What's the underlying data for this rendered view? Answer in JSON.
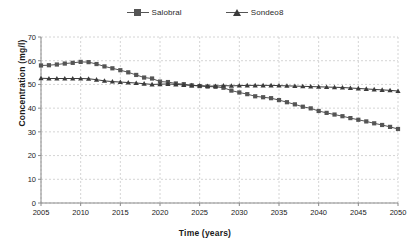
{
  "chart_data": {
    "type": "line",
    "title": "",
    "xlabel": "Time (years)",
    "ylabel": "Concentration (mg/l)",
    "xlim": [
      2005,
      2050
    ],
    "ylim": [
      0,
      70
    ],
    "ytick_step": 10,
    "xtick_step": 5,
    "xticks": [
      "2005",
      "2010",
      "2015",
      "2020",
      "2025",
      "2030",
      "2035",
      "2040",
      "2045",
      "2050"
    ],
    "yticks": [
      "0",
      "10",
      "20",
      "30",
      "40",
      "50",
      "60",
      "70"
    ],
    "grid": true,
    "grid_style": "dashed",
    "grid_color": "#c9c9c9",
    "legend_position": "top-center",
    "x": [
      2005,
      2006,
      2007,
      2008,
      2009,
      2010,
      2011,
      2012,
      2013,
      2014,
      2015,
      2016,
      2017,
      2018,
      2019,
      2020,
      2021,
      2022,
      2023,
      2024,
      2025,
      2026,
      2027,
      2028,
      2029,
      2030,
      2031,
      2032,
      2033,
      2034,
      2035,
      2036,
      2037,
      2038,
      2039,
      2040,
      2041,
      2042,
      2043,
      2044,
      2045,
      2046,
      2047,
      2048,
      2049,
      2050
    ],
    "series": [
      {
        "name": "Salobral",
        "color": "#555555",
        "marker": "square",
        "values": [
          58.0,
          58.1,
          58.4,
          58.8,
          59.1,
          59.5,
          59.4,
          58.6,
          57.6,
          56.8,
          56.0,
          55.1,
          54.0,
          52.9,
          52.5,
          51.2,
          51.0,
          50.4,
          50.1,
          49.6,
          49.3,
          49.1,
          49.0,
          48.6,
          47.4,
          46.6,
          45.9,
          45.0,
          44.6,
          44.2,
          43.4,
          42.5,
          41.6,
          40.6,
          39.9,
          38.8,
          38.0,
          37.3,
          36.6,
          35.8,
          35.1,
          34.4,
          33.6,
          32.9,
          32.1,
          31.2
        ]
      },
      {
        "name": "Sondeo8",
        "color": "#3b3b3b",
        "marker": "triangle",
        "values": [
          52.6,
          52.5,
          52.5,
          52.5,
          52.5,
          52.5,
          52.4,
          52.0,
          51.5,
          51.2,
          51.0,
          50.8,
          50.6,
          50.3,
          50.0,
          50.1,
          50.2,
          50.0,
          49.8,
          49.6,
          49.5,
          49.3,
          49.3,
          49.5,
          49.4,
          49.5,
          49.6,
          49.6,
          49.6,
          49.6,
          49.5,
          49.4,
          49.3,
          49.2,
          49.1,
          49.0,
          48.9,
          48.8,
          48.7,
          48.5,
          48.3,
          48.1,
          47.9,
          47.7,
          47.5,
          47.2
        ]
      }
    ]
  },
  "legend": {
    "items": [
      {
        "label": "Salobral",
        "marker": "square-marker"
      },
      {
        "label": "Sondeo8",
        "marker": "triangle-marker"
      }
    ]
  },
  "axes": {
    "x_title": "Time (years)",
    "y_title": "Concentration (mg/l)"
  }
}
